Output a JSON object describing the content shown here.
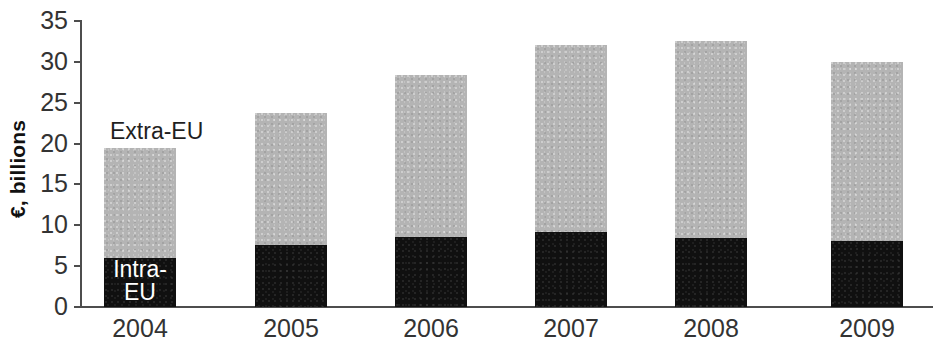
{
  "chart_data": {
    "type": "bar",
    "stacked": true,
    "title": "",
    "subtitle": "",
    "xlabel": "",
    "ylabel": "€, billions",
    "categories": [
      "2004",
      "2005",
      "2006",
      "2007",
      "2008",
      "2009"
    ],
    "series": [
      {
        "name": "Intra-EU",
        "color": "#101010",
        "values": [
          6.0,
          7.6,
          8.6,
          9.2,
          8.4,
          8.1
        ]
      },
      {
        "name": "Extra-EU",
        "color": "#b4b4b4",
        "values": [
          13.4,
          16.1,
          19.8,
          22.9,
          24.1,
          21.9
        ]
      }
    ],
    "totals": [
      19.4,
      23.7,
      28.4,
      32.1,
      32.5,
      30.0
    ],
    "ylim": [
      0,
      35
    ],
    "yticks": [
      0,
      5,
      10,
      15,
      20,
      25,
      30,
      35
    ],
    "ytick_labels": [
      "0",
      "5",
      "10",
      "15",
      "20",
      "25",
      "30",
      "35"
    ],
    "grid": false,
    "legend_position": "inline-annotations",
    "annotations": [
      {
        "text": "Extra-EU",
        "target": "extra-eu-series",
        "color": "#1f1f1f"
      },
      {
        "text_line1": "Intra-",
        "text_line2": "EU",
        "target": "intra-eu-series",
        "color": "#ffffff"
      }
    ]
  },
  "axis": {
    "y_title": "€, billions",
    "y_labels": [
      "35",
      "30",
      "25",
      "20",
      "15",
      "10",
      "5",
      "0"
    ],
    "x_labels": [
      "2004",
      "2005",
      "2006",
      "2007",
      "2008",
      "2009"
    ]
  },
  "labels": {
    "extra_eu": "Extra-EU",
    "intra_eu_line1": "Intra-",
    "intra_eu_line2": "EU"
  }
}
